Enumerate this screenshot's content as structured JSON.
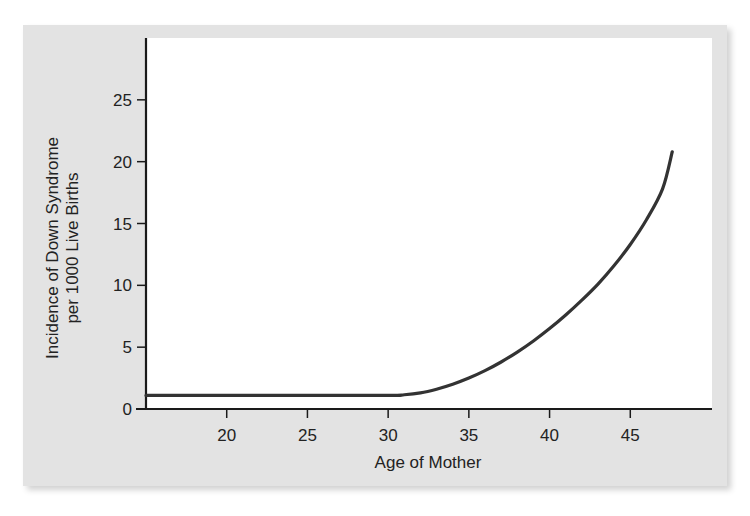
{
  "chart_data": {
    "type": "line",
    "title": "",
    "xlabel": "Age of Mother",
    "ylabel_lines": [
      "Incidence of Down Syndrome",
      "per 1000 Live Births"
    ],
    "ylabel": "Incidence of Down Syndrome per 1000 Live Births",
    "xlim": [
      15,
      50
    ],
    "ylim": [
      0,
      30
    ],
    "xticks": [
      20,
      25,
      30,
      35,
      40,
      45
    ],
    "yticks": [
      0,
      5,
      10,
      15,
      20,
      25
    ],
    "grid": false,
    "legend": null,
    "series": [
      {
        "name": "Incidence",
        "color": "#333333",
        "x": [
          15,
          20,
          25,
          30,
          31,
          32,
          33,
          34,
          35,
          36,
          37,
          38,
          39,
          40,
          41,
          42,
          43,
          44,
          45,
          46,
          47,
          47.6
        ],
        "y": [
          1.1,
          1.1,
          1.1,
          1.1,
          1.15,
          1.3,
          1.6,
          2.0,
          2.5,
          3.1,
          3.8,
          4.6,
          5.5,
          6.5,
          7.6,
          8.8,
          10.1,
          11.6,
          13.3,
          15.3,
          17.8,
          20.8
        ]
      }
    ]
  },
  "labels": {
    "x_axis_title": "Age of Mother",
    "y_axis_title_line1": "Incidence of Down Syndrome",
    "y_axis_title_line2": "per 1000 Live Births"
  },
  "colors": {
    "panel_background": "#e3e3e3",
    "plot_background": "#ffffff",
    "line": "#333333",
    "axis": "#1a1a1a"
  }
}
